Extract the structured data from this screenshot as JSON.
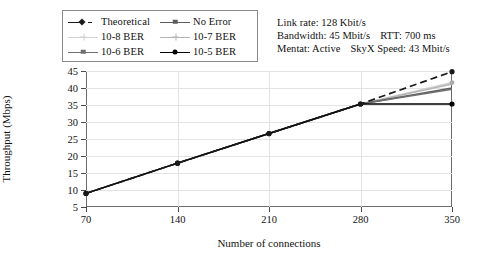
{
  "chart_data": {
    "type": "line",
    "title": "",
    "xlabel": "Number of connections",
    "ylabel": "Throughput (Mbps)",
    "x": [
      70,
      140,
      210,
      280,
      350
    ],
    "xticks": [
      "70",
      "140",
      "210",
      "280",
      "350"
    ],
    "yticks": [
      "5",
      "10",
      "15",
      "20",
      "25",
      "30",
      "35",
      "40",
      "45"
    ],
    "xlim": [
      70,
      350
    ],
    "ylim": [
      5,
      45
    ],
    "grid": true,
    "legend_position": "top-left",
    "series": [
      {
        "name": "Theoretical",
        "values": [
          9.0,
          17.9,
          26.6,
          35.3,
          44.8
        ],
        "color": "#1a1a1a",
        "dash": "dashed",
        "marker": "diamond"
      },
      {
        "name": "No Error",
        "values": [
          9.0,
          17.9,
          26.6,
          35.3,
          40.0
        ],
        "color": "#5d5d5d",
        "dash": "solid",
        "marker": "square"
      },
      {
        "name": "10-8 BER",
        "values": [
          9.0,
          17.9,
          26.6,
          35.3,
          41.6
        ],
        "color": "#d2d2d2",
        "dash": "solid",
        "marker": "plus"
      },
      {
        "name": "10-7 BER",
        "values": [
          9.0,
          17.9,
          26.6,
          35.3,
          41.2
        ],
        "color": "#b4b4b4",
        "dash": "solid",
        "marker": "plus"
      },
      {
        "name": "10-6 BER",
        "values": [
          9.0,
          17.9,
          26.6,
          35.3,
          39.6
        ],
        "color": "#6e6e6e",
        "dash": "solid",
        "marker": "square"
      },
      {
        "name": "10-5 BER",
        "values": [
          9.0,
          17.9,
          26.6,
          35.3,
          35.3
        ],
        "color": "#000000",
        "dash": "solid",
        "marker": "circle"
      }
    ]
  },
  "legend": {
    "entries": [
      {
        "label": "Theoretical",
        "marker": "diamond-marker",
        "color": "#1a1a1a"
      },
      {
        "label": "No Error",
        "marker": "square-marker",
        "color": "#5d5d5d"
      },
      {
        "label": "10-8 BER",
        "marker": "plus-marker",
        "color": "#d2d2d2"
      },
      {
        "label": "10-7 BER",
        "marker": "plus-marker",
        "color": "#b4b4b4"
      },
      {
        "label": "10-6 BER",
        "marker": "square-marker",
        "color": "#6e6e6e"
      },
      {
        "label": "10-5 BER",
        "marker": "circle-marker",
        "color": "#000000"
      }
    ]
  },
  "annotation": {
    "line1": "Link rate: 128 Kbit/s",
    "line2_a": "Bandwidth: 45 Mbit/s",
    "line2_b": "RTT: 700 ms",
    "line3_a": "Mentat: Active",
    "line3_b": "SkyX Speed: 43 Mbit/s"
  }
}
